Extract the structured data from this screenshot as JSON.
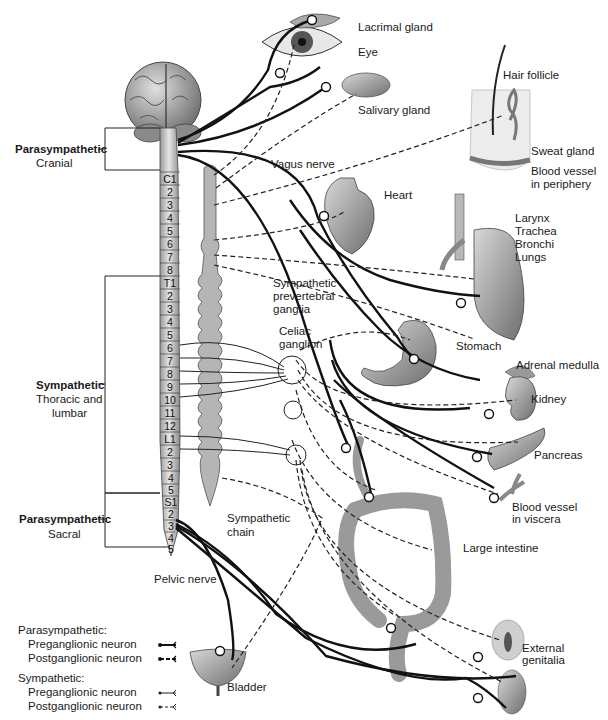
{
  "divisions": {
    "parasympathetic_cranial": {
      "title": "Parasympathetic",
      "subtitle": "Cranial"
    },
    "sympathetic": {
      "title": "Sympathetic",
      "subtitle_line1": "Thoracic and",
      "subtitle_line2": "lumbar"
    },
    "parasympathetic_sacral": {
      "title": "Parasympathetic",
      "subtitle": "Sacral"
    }
  },
  "vertebrae": [
    "C1",
    "2",
    "3",
    "4",
    "5",
    "6",
    "7",
    "8",
    "T1",
    "2",
    "3",
    "4",
    "5",
    "6",
    "7",
    "8",
    "9",
    "10",
    "11",
    "12",
    "L1",
    "2",
    "3",
    "4",
    "5",
    "S1",
    "2",
    "3",
    "4",
    "5"
  ],
  "nerves": {
    "vagus": "Vagus nerve",
    "pelvic": "Pelvic nerve"
  },
  "ganglia": {
    "prevertebral_line1": "Sympathetic",
    "prevertebral_line2": "prevertebral",
    "prevertebral_line3": "ganglia",
    "celiac_line1": "Celiac",
    "celiac_line2": "ganglion",
    "chain_line1": "Sympathetic",
    "chain_line2": "chain"
  },
  "organs": {
    "lacrimal_gland": "Lacrimal gland",
    "eye": "Eye",
    "salivary_gland": "Salivary gland",
    "hair_follicle": "Hair follicle",
    "sweat_gland": "Sweat gland",
    "blood_vessel_periphery_line1": "Blood vessel",
    "blood_vessel_periphery_line2": "in periphery",
    "heart": "Heart",
    "larynx": "Larynx",
    "trachea": "Trachea",
    "bronchi": "Bronchi",
    "lungs": "Lungs",
    "stomach": "Stomach",
    "adrenal_medulla": "Adrenal medulla",
    "kidney": "Kidney",
    "pancreas": "Pancreas",
    "blood_vessel_viscera_line1": "Blood vessel",
    "blood_vessel_viscera_line2": "in viscera",
    "large_intestine": "Large intestine",
    "bladder": "Bladder",
    "external_genitalia_line1": "External",
    "external_genitalia_line2": "genitalia"
  },
  "legend": {
    "parasympathetic_heading": "Parasympathetic:",
    "parasympathetic_pre": "Preganglionic neuron",
    "parasympathetic_post": "Postganglionic neuron",
    "sympathetic_heading": "Sympathetic:",
    "sympathetic_pre": "Preganglionic neuron",
    "sympathetic_post": "Postganglionic neuron"
  },
  "colors": {
    "parasympathetic_line": "#111111",
    "sympathetic_line": "#333333",
    "spine_fill": "#c9c9c9",
    "organ_fill": "#9a9a9a"
  }
}
